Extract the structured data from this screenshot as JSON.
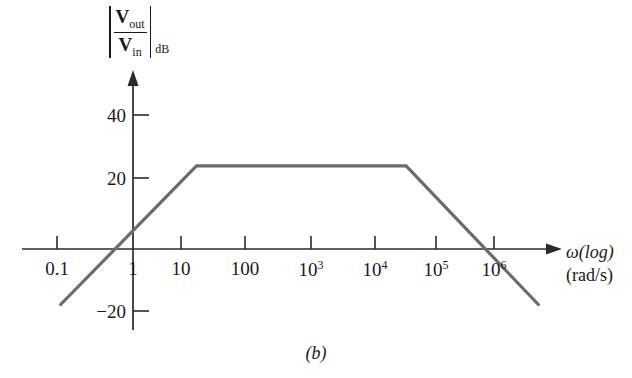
{
  "figure": {
    "caption": "(b)",
    "type": "bode-magnitude-plot"
  },
  "axes": {
    "y_title": {
      "numerator": "V",
      "numerator_sub": "out",
      "denominator": "V",
      "denominator_sub": "in",
      "unit_sub": "dB"
    },
    "x_title_line1": "ω(log)",
    "x_title_line2": "(rad/s)",
    "y_ticks": [
      {
        "label": "40",
        "value": 40
      },
      {
        "label": "20",
        "value": 20
      },
      {
        "label": "−20",
        "value": -20
      }
    ],
    "x_ticks": [
      {
        "mantissa": "0.1",
        "exp": "",
        "value": 0.1
      },
      {
        "mantissa": "1",
        "exp": "",
        "value": 1
      },
      {
        "mantissa": "10",
        "exp": "",
        "value": 10
      },
      {
        "mantissa": "100",
        "exp": "",
        "value": 100
      },
      {
        "mantissa": "10",
        "exp": "3",
        "value": 1000
      },
      {
        "mantissa": "10",
        "exp": "4",
        "value": 10000
      },
      {
        "mantissa": "10",
        "exp": "5",
        "value": 100000
      },
      {
        "mantissa": "10",
        "exp": "6",
        "value": 1000000
      }
    ]
  },
  "chart_data": {
    "type": "line",
    "title": "",
    "xlabel": "ω(log) (rad/s)",
    "ylabel": "|Vout/Vin| dB",
    "xscale": "log",
    "xlim": [
      0.05,
      3000000
    ],
    "ylim": [
      -22,
      45
    ],
    "grid": false,
    "legend": null,
    "series": [
      {
        "name": "magnitude-asymptote",
        "color": "#6b6b6b",
        "points": [
          {
            "x": 0.07,
            "y": -17
          },
          {
            "x": 10,
            "y": 25
          },
          {
            "x": 20000,
            "y": 25
          },
          {
            "x": 2500000,
            "y": -17
          }
        ],
        "annotations": [
          {
            "label": "rising slope +20 dB/decade",
            "x_from": 0.07,
            "x_to": 10
          },
          {
            "label": "flat passband 25 dB",
            "x_from": 10,
            "x_to": 20000
          },
          {
            "label": "falling slope −20 dB/decade",
            "x_from": 20000,
            "x_to": 2500000
          }
        ]
      }
    ]
  },
  "colors": {
    "axis": "#2b2b2b",
    "curve": "#6b6b6b",
    "text": "#1a1a1a",
    "background": "#ffffff"
  }
}
